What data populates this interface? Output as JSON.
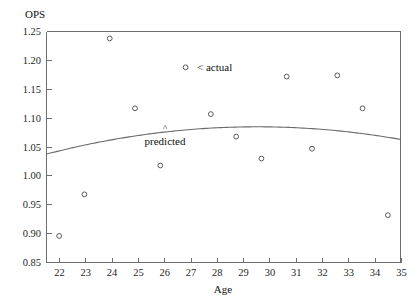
{
  "chart_data": {
    "type": "scatter",
    "title": "",
    "xlabel": "Age",
    "ylabel": "OPS",
    "xlim": [
      21.5,
      35.5
    ],
    "ylim": [
      0.85,
      1.25
    ],
    "grid": false,
    "legend": "none",
    "x_ticks": [
      22,
      23,
      24,
      25,
      26,
      27,
      28,
      29,
      30,
      31,
      32,
      33,
      34,
      35
    ],
    "x_tick_labels": [
      "22",
      "23",
      "24",
      "25",
      "26",
      "27",
      "28",
      "29",
      "30",
      "31",
      "32",
      "33",
      "34",
      "35"
    ],
    "y_ticks": [
      0.85,
      0.9,
      0.95,
      1.0,
      1.05,
      1.1,
      1.15,
      1.2,
      1.25
    ],
    "y_tick_labels": [
      "0.85",
      "0.90",
      "0.95",
      "1.00",
      "1.05",
      "1.10",
      "1.15",
      "1.20",
      "1.25"
    ],
    "series": [
      {
        "name": "actual",
        "type": "scatter",
        "marker": "open-circle",
        "color": "#5a5a5a",
        "x": [
          22,
          23,
          24,
          25,
          26,
          27,
          28,
          29,
          30,
          31,
          32,
          33,
          34,
          35
        ],
        "values": [
          0.896,
          0.968,
          1.238,
          1.117,
          1.018,
          1.188,
          1.107,
          1.068,
          1.03,
          1.172,
          1.047,
          1.174,
          1.117,
          0.932
        ]
      },
      {
        "name": "predicted",
        "type": "line",
        "color": "#6a6a6a",
        "x": [
          22,
          23,
          24,
          25,
          26,
          27,
          28,
          29,
          30,
          31,
          32,
          33,
          34,
          35
        ],
        "values": [
          1.043,
          1.053,
          1.062,
          1.069,
          1.075,
          1.08,
          1.083,
          1.085,
          1.085,
          1.084,
          1.081,
          1.077,
          1.073,
          1.068
        ]
      }
    ],
    "annotations": [
      {
        "text": "< actual",
        "x": 27,
        "y": 1.188,
        "note": "label to the right of the age-27 data point"
      },
      {
        "text": "predicted",
        "x": 26.2,
        "y": 1.048,
        "note": "label below the fitted curve"
      },
      {
        "text": "^",
        "x": 26.4,
        "y": 1.072,
        "note": "caret pointing up at the fitted curve"
      }
    ]
  },
  "colors": {
    "axis": "#6e6e6e",
    "point": "#5a5a5a",
    "curve": "#6a6a6a",
    "text": "#111111",
    "background": "#ffffff"
  }
}
